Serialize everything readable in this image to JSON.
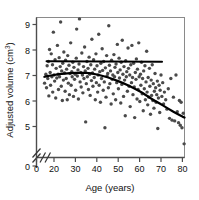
{
  "chart_data": {
    "type": "scatter",
    "title": "",
    "subtitle": "",
    "xlabel": "Age (years)",
    "ylabel": "Adjusted volume (cm3)",
    "ylabel_base": "Adjusted volume (cm",
    "ylabel_sup": "3",
    "ylabel_close": ")",
    "xlim": [
      14,
      82
    ],
    "ylim": [
      4.55,
      9.35
    ],
    "xticks": [
      0,
      20,
      30,
      40,
      50,
      60,
      70,
      80
    ],
    "xtick_labels": [
      "0",
      "20",
      "30",
      "40",
      "50",
      "60",
      "70",
      "80"
    ],
    "yticks": [
      0,
      5,
      6,
      7,
      8,
      9
    ],
    "ytick_labels": [
      "0",
      "5",
      "6",
      "7",
      "8",
      "9"
    ],
    "grid": false,
    "legend": "none",
    "axis_break_x": true,
    "axis_break_y": true,
    "marker": {
      "shape": "circle",
      "color": "#4a4a4a",
      "size_px": 3.4
    },
    "frame_color": "#8a8a8a",
    "line_color": "#000000",
    "series": [
      {
        "name": "Adjusted volume observations",
        "type": "scatter",
        "points": [
          [
            15.6,
            6.7
          ],
          [
            16.2,
            7.05
          ],
          [
            16.5,
            6.52
          ],
          [
            16.8,
            7.38
          ],
          [
            17.1,
            6.88
          ],
          [
            17.4,
            7.55
          ],
          [
            17.6,
            6.2
          ],
          [
            17.9,
            8.02
          ],
          [
            18.2,
            7.12
          ],
          [
            18.4,
            6.62
          ],
          [
            18.7,
            7.85
          ],
          [
            19.0,
            6.95
          ],
          [
            19.3,
            7.42
          ],
          [
            19.4,
            6.35
          ],
          [
            19.7,
            8.7
          ],
          [
            20.0,
            7.02
          ],
          [
            20.3,
            6.78
          ],
          [
            20.5,
            7.62
          ],
          [
            20.8,
            6.12
          ],
          [
            21.0,
            7.28
          ],
          [
            21.3,
            6.9
          ],
          [
            21.6,
            8.18
          ],
          [
            21.9,
            7.05
          ],
          [
            22.1,
            6.45
          ],
          [
            22.4,
            7.7
          ],
          [
            22.6,
            6.95
          ],
          [
            22.9,
            7.35
          ],
          [
            23.1,
            9.1
          ],
          [
            23.4,
            6.58
          ],
          [
            23.6,
            7.18
          ],
          [
            23.9,
            6.02
          ],
          [
            24.1,
            7.48
          ],
          [
            24.4,
            6.82
          ],
          [
            24.6,
            7.92
          ],
          [
            24.9,
            7.1
          ],
          [
            25.2,
            6.38
          ],
          [
            25.4,
            7.6
          ],
          [
            25.7,
            6.88
          ],
          [
            25.9,
            7.25
          ],
          [
            26.2,
            6.05
          ],
          [
            26.4,
            7.78
          ],
          [
            26.7,
            6.7
          ],
          [
            27.0,
            7.4
          ],
          [
            27.2,
            6.25
          ],
          [
            27.5,
            7.08
          ],
          [
            27.8,
            8.28
          ],
          [
            28.0,
            6.62
          ],
          [
            28.3,
            7.15
          ],
          [
            28.5,
            6.95
          ],
          [
            28.8,
            7.52
          ],
          [
            29.1,
            6.18
          ],
          [
            29.3,
            7.32
          ],
          [
            29.6,
            6.85
          ],
          [
            29.9,
            7.05
          ],
          [
            30.1,
            6.42
          ],
          [
            30.4,
            7.68
          ],
          [
            30.6,
            8.82
          ],
          [
            30.9,
            6.98
          ],
          [
            31.2,
            7.22
          ],
          [
            31.4,
            6.08
          ],
          [
            31.7,
            7.45
          ],
          [
            31.9,
            9.22
          ],
          [
            32.2,
            6.75
          ],
          [
            32.5,
            7.12
          ],
          [
            32.7,
            6.55
          ],
          [
            33.0,
            7.88
          ],
          [
            33.3,
            7.02
          ],
          [
            33.5,
            6.32
          ],
          [
            33.8,
            7.35
          ],
          [
            34.0,
            6.88
          ],
          [
            34.3,
            8.12
          ],
          [
            34.6,
            7.18
          ],
          [
            34.8,
            5.18
          ],
          [
            35.1,
            6.68
          ],
          [
            35.4,
            7.55
          ],
          [
            35.6,
            6.95
          ],
          [
            35.9,
            7.28
          ],
          [
            36.1,
            6.45
          ],
          [
            36.4,
            7.72
          ],
          [
            36.7,
            7.05
          ],
          [
            36.9,
            6.22
          ],
          [
            37.2,
            7.42
          ],
          [
            37.5,
            6.8
          ],
          [
            37.7,
            8.42
          ],
          [
            38.0,
            7.1
          ],
          [
            38.2,
            6.58
          ],
          [
            38.5,
            7.62
          ],
          [
            38.8,
            6.92
          ],
          [
            39.0,
            7.25
          ],
          [
            39.3,
            6.05
          ],
          [
            39.6,
            7.85
          ],
          [
            39.8,
            6.72
          ],
          [
            40.1,
            7.38
          ],
          [
            40.4,
            6.35
          ],
          [
            40.6,
            7.02
          ],
          [
            40.9,
            8.62
          ],
          [
            41.1,
            6.62
          ],
          [
            41.4,
            7.15
          ],
          [
            41.7,
            5.95
          ],
          [
            41.9,
            7.48
          ],
          [
            42.2,
            6.88
          ],
          [
            42.5,
            8.05
          ],
          [
            42.7,
            7.2
          ],
          [
            43.0,
            6.42
          ],
          [
            43.2,
            7.55
          ],
          [
            43.5,
            6.75
          ],
          [
            43.8,
            4.95
          ],
          [
            44.0,
            7.3
          ],
          [
            44.3,
            6.15
          ],
          [
            44.6,
            7.78
          ],
          [
            44.8,
            6.98
          ],
          [
            45.1,
            7.08
          ],
          [
            45.4,
            6.52
          ],
          [
            45.6,
            8.95
          ],
          [
            45.9,
            7.4
          ],
          [
            46.1,
            6.68
          ],
          [
            46.4,
            7.18
          ],
          [
            46.7,
            5.88
          ],
          [
            46.9,
            7.6
          ],
          [
            47.2,
            6.85
          ],
          [
            47.5,
            7.02
          ],
          [
            47.7,
            6.28
          ],
          [
            48.0,
            7.82
          ],
          [
            48.3,
            6.95
          ],
          [
            48.5,
            7.32
          ],
          [
            48.8,
            6.05
          ],
          [
            49.0,
            7.45
          ],
          [
            49.3,
            6.72
          ],
          [
            49.6,
            8.22
          ],
          [
            49.8,
            7.12
          ],
          [
            50.1,
            6.48
          ],
          [
            50.4,
            7.68
          ],
          [
            50.6,
            6.9
          ],
          [
            50.9,
            7.22
          ],
          [
            51.2,
            5.92
          ],
          [
            51.4,
            7.52
          ],
          [
            51.7,
            6.65
          ],
          [
            51.9,
            8.38
          ],
          [
            52.2,
            7.05
          ],
          [
            52.5,
            6.18
          ],
          [
            52.7,
            7.35
          ],
          [
            53.0,
            6.82
          ],
          [
            53.3,
            5.42
          ],
          [
            53.5,
            7.58
          ],
          [
            53.8,
            6.95
          ],
          [
            54.0,
            7.15
          ],
          [
            54.3,
            6.38
          ],
          [
            54.6,
            8.08
          ],
          [
            54.8,
            7.28
          ],
          [
            55.1,
            6.58
          ],
          [
            55.4,
            7.02
          ],
          [
            55.6,
            5.78
          ],
          [
            55.9,
            7.42
          ],
          [
            56.2,
            6.72
          ],
          [
            56.4,
            8.18
          ],
          [
            56.7,
            6.92
          ],
          [
            56.9,
            6.25
          ],
          [
            57.2,
            7.48
          ],
          [
            57.5,
            6.55
          ],
          [
            57.7,
            5.35
          ],
          [
            58.0,
            7.12
          ],
          [
            58.3,
            6.85
          ],
          [
            58.5,
            7.65
          ],
          [
            58.8,
            6.08
          ],
          [
            59.0,
            7.25
          ],
          [
            59.3,
            6.45
          ],
          [
            59.6,
            8.28
          ],
          [
            59.8,
            6.95
          ],
          [
            60.1,
            5.98
          ],
          [
            60.4,
            7.05
          ],
          [
            60.6,
            6.62
          ],
          [
            60.9,
            7.52
          ],
          [
            61.2,
            6.28
          ],
          [
            61.4,
            6.88
          ],
          [
            61.7,
            5.62
          ],
          [
            61.9,
            7.18
          ],
          [
            62.2,
            6.48
          ],
          [
            62.5,
            7.38
          ],
          [
            62.7,
            6.05
          ],
          [
            63.0,
            6.75
          ],
          [
            63.3,
            7.95
          ],
          [
            63.5,
            6.35
          ],
          [
            63.8,
            5.85
          ],
          [
            64.0,
            6.92
          ],
          [
            64.3,
            6.15
          ],
          [
            64.6,
            7.28
          ],
          [
            64.8,
            6.58
          ],
          [
            65.1,
            5.48
          ],
          [
            65.4,
            6.82
          ],
          [
            65.6,
            6.22
          ],
          [
            65.9,
            7.42
          ],
          [
            66.2,
            6.02
          ],
          [
            66.4,
            6.68
          ],
          [
            66.7,
            5.72
          ],
          [
            66.9,
            6.38
          ],
          [
            67.2,
            7.08
          ],
          [
            67.5,
            6.52
          ],
          [
            67.7,
            5.95
          ],
          [
            68.0,
            6.25
          ],
          [
            68.3,
            6.78
          ],
          [
            68.5,
            4.92
          ],
          [
            68.8,
            6.12
          ],
          [
            69.1,
            6.62
          ],
          [
            69.4,
            5.55
          ],
          [
            69.6,
            6.42
          ],
          [
            70.0,
            7.02
          ],
          [
            70.4,
            6.18
          ],
          [
            70.8,
            6.72
          ],
          [
            71.2,
            5.88
          ],
          [
            71.6,
            6.35
          ],
          [
            72.2,
            6.05
          ],
          [
            72.8,
            5.68
          ],
          [
            73.4,
            6.48
          ],
          [
            74.0,
            5.32
          ],
          [
            74.6,
            6.88
          ],
          [
            75.2,
            5.25
          ],
          [
            75.8,
            6.15
          ],
          [
            76.4,
            5.22
          ],
          [
            77.0,
            7.02
          ],
          [
            77.6,
            5.58
          ],
          [
            78.2,
            5.15
          ],
          [
            78.6,
            6.02
          ],
          [
            79.0,
            5.05
          ],
          [
            79.4,
            5.95
          ],
          [
            79.8,
            4.95
          ],
          [
            80.4,
            5.52
          ],
          [
            80.8,
            4.32
          ]
        ]
      },
      {
        "name": "Unadjusted flat regression line",
        "type": "line",
        "style": "solid",
        "xrange": [
          16.5,
          70.5
        ],
        "values": [
          [
            16.5,
            7.56
          ],
          [
            43.5,
            7.55
          ],
          [
            70.5,
            7.54
          ]
        ]
      },
      {
        "name": "Age-adjusted fitted curve",
        "type": "line",
        "style": "solid",
        "xrange": [
          15.5,
          81.0
        ],
        "values": [
          [
            15.5,
            6.95
          ],
          [
            20.0,
            7.02
          ],
          [
            25.0,
            7.07
          ],
          [
            30.0,
            7.1
          ],
          [
            35.0,
            7.1
          ],
          [
            40.0,
            7.04
          ],
          [
            45.0,
            6.93
          ],
          [
            50.0,
            6.78
          ],
          [
            55.0,
            6.6
          ],
          [
            60.0,
            6.38
          ],
          [
            65.0,
            6.12
          ],
          [
            70.0,
            5.87
          ],
          [
            75.0,
            5.62
          ],
          [
            81.0,
            5.35
          ]
        ]
      }
    ]
  }
}
